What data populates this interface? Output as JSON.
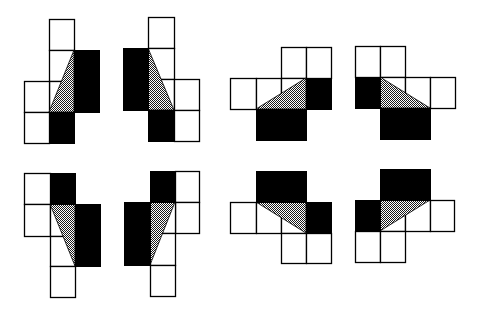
{
  "colors": {
    "background": "#ffffff",
    "outline": "#000000",
    "solid": "#000000",
    "dot_dark": "#1a1a1a",
    "dot_light": "#ffffff"
  },
  "figures": [
    {
      "name": "figure-1",
      "white_cells": [
        [
          49,
          19,
          25,
          31
        ],
        [
          49,
          50,
          25,
          31
        ],
        [
          49,
          81,
          25,
          31
        ],
        [
          24,
          81,
          25,
          31
        ],
        [
          24,
          112,
          25,
          31
        ]
      ],
      "black_cells": [
        [
          49,
          112,
          25,
          31
        ],
        [
          74,
          50,
          25,
          62
        ]
      ],
      "triangle": [
        [
          74,
          50
        ],
        [
          49,
          112
        ],
        [
          74,
          112
        ]
      ]
    },
    {
      "name": "figure-2",
      "white_cells": [
        [
          148,
          17,
          26,
          31
        ],
        [
          148,
          48,
          26,
          31
        ],
        [
          148,
          79,
          26,
          31
        ],
        [
          174,
          79,
          25,
          31
        ],
        [
          174,
          110,
          25,
          31
        ]
      ],
      "black_cells": [
        [
          123,
          48,
          25,
          62
        ],
        [
          148,
          110,
          26,
          31
        ]
      ],
      "triangle": [
        [
          148,
          48
        ],
        [
          174,
          110
        ],
        [
          148,
          110
        ]
      ]
    },
    {
      "name": "figure-3",
      "white_cells": [
        [
          281,
          47,
          25,
          31
        ],
        [
          306,
          47,
          25,
          31
        ],
        [
          230,
          78,
          26,
          31
        ],
        [
          256,
          78,
          25,
          31
        ],
        [
          281,
          78,
          25,
          31
        ]
      ],
      "black_cells": [
        [
          306,
          78,
          25,
          31
        ],
        [
          256,
          109,
          50,
          31
        ]
      ],
      "triangle": [
        [
          306,
          78
        ],
        [
          256,
          109
        ],
        [
          306,
          109
        ]
      ]
    },
    {
      "name": "figure-4",
      "white_cells": [
        [
          355,
          46,
          25,
          31
        ],
        [
          380,
          46,
          25,
          31
        ],
        [
          380,
          77,
          25,
          31
        ],
        [
          405,
          77,
          25,
          31
        ],
        [
          430,
          77,
          25,
          31
        ]
      ],
      "black_cells": [
        [
          355,
          77,
          25,
          31
        ],
        [
          380,
          108,
          50,
          31
        ]
      ],
      "triangle": [
        [
          380,
          77
        ],
        [
          430,
          108
        ],
        [
          380,
          108
        ]
      ]
    },
    {
      "name": "figure-5",
      "white_cells": [
        [
          24,
          173,
          26,
          31
        ],
        [
          24,
          204,
          26,
          32
        ],
        [
          50,
          204,
          25,
          32
        ],
        [
          50,
          236,
          25,
          30
        ],
        [
          50,
          266,
          25,
          31
        ]
      ],
      "black_cells": [
        [
          50,
          173,
          25,
          31
        ],
        [
          75,
          204,
          25,
          62
        ]
      ],
      "triangle": [
        [
          50,
          204
        ],
        [
          75,
          204
        ],
        [
          75,
          266
        ]
      ]
    },
    {
      "name": "figure-6",
      "white_cells": [
        [
          175,
          171,
          24,
          31
        ],
        [
          175,
          202,
          24,
          31
        ],
        [
          150,
          202,
          25,
          31
        ],
        [
          150,
          233,
          25,
          32
        ],
        [
          150,
          265,
          25,
          31
        ]
      ],
      "black_cells": [
        [
          150,
          171,
          25,
          31
        ],
        [
          124,
          202,
          26,
          63
        ]
      ],
      "triangle": [
        [
          150,
          202
        ],
        [
          175,
          202
        ],
        [
          150,
          265
        ]
      ]
    },
    {
      "name": "figure-7",
      "white_cells": [
        [
          230,
          202,
          26,
          31
        ],
        [
          256,
          202,
          25,
          31
        ],
        [
          281,
          202,
          25,
          31
        ],
        [
          281,
          233,
          25,
          30
        ],
        [
          306,
          233,
          25,
          30
        ]
      ],
      "black_cells": [
        [
          256,
          171,
          50,
          31
        ],
        [
          306,
          202,
          25,
          31
        ]
      ],
      "triangle": [
        [
          256,
          202
        ],
        [
          306,
          202
        ],
        [
          306,
          233
        ]
      ]
    },
    {
      "name": "figure-8",
      "white_cells": [
        [
          380,
          200,
          25,
          31
        ],
        [
          405,
          200,
          25,
          31
        ],
        [
          430,
          200,
          24,
          31
        ],
        [
          355,
          231,
          25,
          31
        ],
        [
          380,
          231,
          25,
          31
        ]
      ],
      "black_cells": [
        [
          380,
          169,
          50,
          31
        ],
        [
          355,
          200,
          25,
          31
        ]
      ],
      "triangle": [
        [
          380,
          200
        ],
        [
          430,
          200
        ],
        [
          380,
          231
        ]
      ]
    }
  ]
}
